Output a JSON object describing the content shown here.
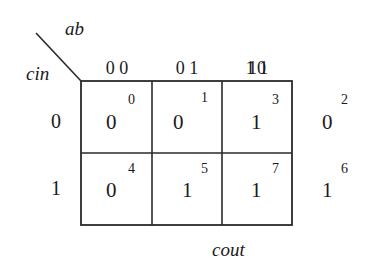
{
  "kmap": {
    "title": "cout",
    "col_var": "ab",
    "row_var": "cin",
    "col_headers": [
      "0 0",
      "0 1",
      "1 1",
      "10"
    ],
    "row_headers": [
      "0",
      "1"
    ],
    "cells": [
      [
        {
          "value": "0",
          "index": "0"
        },
        {
          "value": "0",
          "index": "1"
        },
        {
          "value": "1",
          "index": "3"
        },
        {
          "value": "0",
          "index": "2"
        }
      ],
      [
        {
          "value": "0",
          "index": "4"
        },
        {
          "value": "1",
          "index": "5"
        },
        {
          "value": "1",
          "index": "7"
        },
        {
          "value": "1",
          "index": "6"
        }
      ]
    ]
  },
  "colors": {
    "line": "#2a2a2a",
    "text": "#1a1a1a",
    "background": "#ffffff"
  }
}
